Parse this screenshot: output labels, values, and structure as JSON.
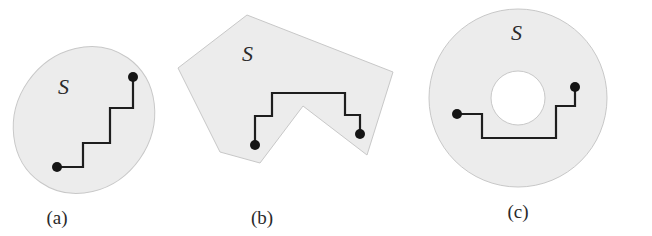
{
  "figure": {
    "panels": [
      {
        "id": "a",
        "caption": "(a)",
        "set_label": "S",
        "region_shape": "ellipse",
        "description": "Convex ellipse region with staircase path between two points"
      },
      {
        "id": "b",
        "caption": "(b)",
        "set_label": "S",
        "region_shape": "non-convex polygon",
        "description": "Non-convex polygon region with path going around the notch"
      },
      {
        "id": "c",
        "caption": "(c)",
        "set_label": "S",
        "region_shape": "annulus",
        "description": "Annulus (disk with hole) region with path passing below the hole"
      }
    ],
    "colors": {
      "region_fill": "#ececec",
      "region_stroke": "#c8c8c8",
      "path": "#1e1e1e",
      "dot": "#151515",
      "text": "#2a2a2a"
    }
  }
}
